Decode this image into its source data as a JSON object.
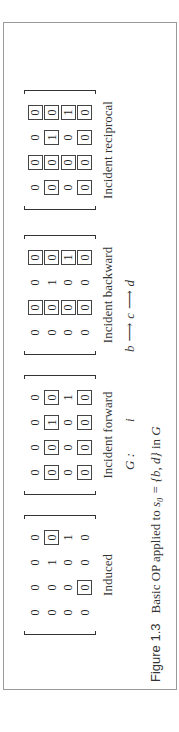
{
  "figure": {
    "caption_label": "Figure 1.3",
    "caption_text_pre": "Basic OP applied to ",
    "caption_math": "s₀ = {b, d}",
    "caption_text_post": " in ",
    "caption_graph": "G"
  },
  "graph": {
    "name": "G :",
    "isolated": "i",
    "nodes": [
      "b",
      "c",
      "d"
    ],
    "arrow": "⟶"
  },
  "matrices": [
    {
      "label": "Induced",
      "rows": [
        [
          {
            "v": "0",
            "b": false
          },
          {
            "v": "0",
            "b": false
          },
          {
            "v": "0",
            "b": false
          },
          {
            "v": "0",
            "b": false
          }
        ],
        [
          {
            "v": "0",
            "b": false
          },
          {
            "v": "0",
            "b": false
          },
          {
            "v": "1",
            "b": false
          },
          {
            "v": "0",
            "b": true
          }
        ],
        [
          {
            "v": "0",
            "b": false
          },
          {
            "v": "0",
            "b": false
          },
          {
            "v": "0",
            "b": false
          },
          {
            "v": "1",
            "b": false
          }
        ],
        [
          {
            "v": "0",
            "b": false
          },
          {
            "v": "0",
            "b": true
          },
          {
            "v": "0",
            "b": false
          },
          {
            "v": "0",
            "b": false
          }
        ]
      ]
    },
    {
      "label": "Incident forward",
      "rows": [
        [
          {
            "v": "0",
            "b": false
          },
          {
            "v": "0",
            "b": false
          },
          {
            "v": "0",
            "b": false
          },
          {
            "v": "0",
            "b": false
          }
        ],
        [
          {
            "v": "0",
            "b": true
          },
          {
            "v": "0",
            "b": true
          },
          {
            "v": "1",
            "b": true
          },
          {
            "v": "0",
            "b": true
          }
        ],
        [
          {
            "v": "0",
            "b": false
          },
          {
            "v": "0",
            "b": false
          },
          {
            "v": "0",
            "b": false
          },
          {
            "v": "1",
            "b": false
          }
        ],
        [
          {
            "v": "0",
            "b": true
          },
          {
            "v": "0",
            "b": true
          },
          {
            "v": "0",
            "b": true
          },
          {
            "v": "0",
            "b": true
          }
        ]
      ]
    },
    {
      "label": "Incident backward",
      "rows": [
        [
          {
            "v": "0",
            "b": false
          },
          {
            "v": "0",
            "b": true
          },
          {
            "v": "0",
            "b": false
          },
          {
            "v": "0",
            "b": true
          }
        ],
        [
          {
            "v": "0",
            "b": false
          },
          {
            "v": "0",
            "b": true
          },
          {
            "v": "1",
            "b": false
          },
          {
            "v": "0",
            "b": true
          }
        ],
        [
          {
            "v": "0",
            "b": false
          },
          {
            "v": "0",
            "b": true
          },
          {
            "v": "0",
            "b": false
          },
          {
            "v": "1",
            "b": true
          }
        ],
        [
          {
            "v": "0",
            "b": false
          },
          {
            "v": "0",
            "b": true
          },
          {
            "v": "0",
            "b": false
          },
          {
            "v": "0",
            "b": true
          }
        ]
      ]
    },
    {
      "label": "Incident reciprocal",
      "rows": [
        [
          {
            "v": "0",
            "b": false
          },
          {
            "v": "0",
            "b": true
          },
          {
            "v": "0",
            "b": false
          },
          {
            "v": "0",
            "b": true
          }
        ],
        [
          {
            "v": "0",
            "b": true
          },
          {
            "v": "0",
            "b": true
          },
          {
            "v": "1",
            "b": true
          },
          {
            "v": "0",
            "b": true
          }
        ],
        [
          {
            "v": "0",
            "b": false
          },
          {
            "v": "0",
            "b": true
          },
          {
            "v": "0",
            "b": false
          },
          {
            "v": "1",
            "b": true
          }
        ],
        [
          {
            "v": "0",
            "b": true
          },
          {
            "v": "0",
            "b": true
          },
          {
            "v": "0",
            "b": true
          },
          {
            "v": "0",
            "b": true
          }
        ]
      ]
    }
  ]
}
